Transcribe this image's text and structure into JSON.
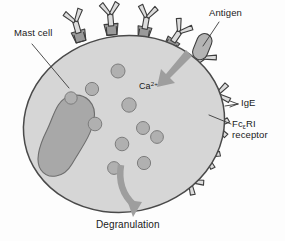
{
  "figure": {
    "kind": "biology-cell-diagram",
    "background_color": "#fdfdfd"
  },
  "labels": {
    "mast_cell": "Mast cell",
    "antigen": "Antigen",
    "ige": "IgE",
    "receptor_line1_prefix": "Fc",
    "receptor_line1_subscript": "ε",
    "receptor_line1_suffix": "RI",
    "receptor_line2": "receptor",
    "calcium_base": "Ca",
    "calcium_superscript": "2+",
    "degranulation": "Degranulation"
  },
  "colors": {
    "cytoplasm": "#d6d6d6",
    "nucleus": "#a8a8a8",
    "granule": "#b0b0b0",
    "membrane_outline": "#4a4a4a",
    "receptor_base": "#9a9a9a",
    "antibody_fill": "#dcdcdc",
    "antigen_fill": "#b4b4b4",
    "flow_arrow": "#9e9e9e",
    "leader_line": "#3a3a3a",
    "text": "#1a1a1a"
  },
  "structures": {
    "cell_body": {
      "label": "mast cell cytoplasm",
      "shape": "ellipse"
    },
    "nucleus": {
      "label": "nucleus",
      "shape": "kidney-bean"
    },
    "granules": {
      "label": "cytoplasmic granules",
      "count": 10,
      "positions": [
        {
          "cx": 118,
          "cy": 71,
          "r": 7.0
        },
        {
          "cx": 92,
          "cy": 89,
          "r": 6.6
        },
        {
          "cx": 71,
          "cy": 98,
          "r": 6.2
        },
        {
          "cx": 129,
          "cy": 105,
          "r": 7.2
        },
        {
          "cx": 95,
          "cy": 124,
          "r": 6.8
        },
        {
          "cx": 143,
          "cy": 128,
          "r": 6.5
        },
        {
          "cx": 122,
          "cy": 144,
          "r": 6.8
        },
        {
          "cx": 157,
          "cy": 137,
          "r": 6.4
        },
        {
          "cx": 144,
          "cy": 163,
          "r": 6.6
        },
        {
          "cx": 114,
          "cy": 168,
          "r": 6.4
        }
      ]
    },
    "receptors": {
      "label": "FcεRI receptors with bound IgE",
      "count": 9,
      "angles_deg": [
        -104,
        -88,
        -70,
        -54,
        -40,
        -20,
        -4,
        12,
        28
      ]
    },
    "antigen_particle": {
      "label": "antigen cross-linking two IgE molecules"
    },
    "calcium_influx_arrow": {
      "label": "calcium influx into cell"
    },
    "degranulation_arrow": {
      "label": "degranulation exit arrow"
    }
  }
}
